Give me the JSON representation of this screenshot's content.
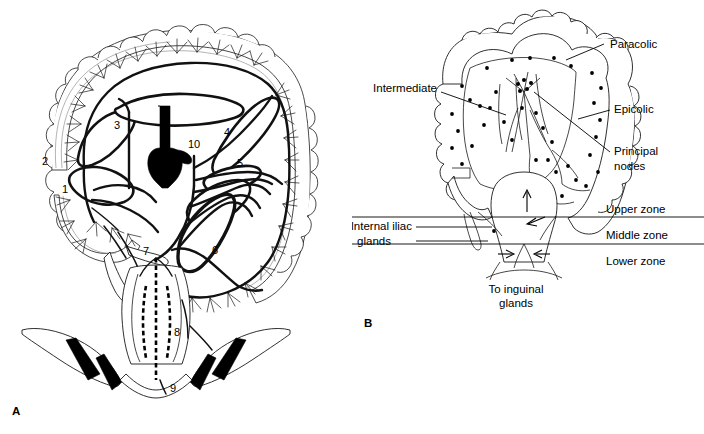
{
  "figure": {
    "panels": [
      {
        "id": "A",
        "letter": "A",
        "caption_letter": "A",
        "description": "Arterial and lymphatic vessel supply of the colon and rectum with numbered structures",
        "numbered_markers": [
          {
            "n": "1",
            "x": 65,
            "y": 193
          },
          {
            "n": "2",
            "x": 45,
            "y": 165
          },
          {
            "n": "3",
            "x": 117,
            "y": 129
          },
          {
            "n": "4",
            "x": 227,
            "y": 136
          },
          {
            "n": "5",
            "x": 240,
            "y": 167
          },
          {
            "n": "6",
            "x": 215,
            "y": 254
          },
          {
            "n": "7",
            "x": 146,
            "y": 255
          },
          {
            "n": "8",
            "x": 177,
            "y": 336
          },
          {
            "n": "9",
            "x": 173,
            "y": 392
          },
          {
            "n": "10",
            "x": 194,
            "y": 148
          }
        ]
      },
      {
        "id": "B",
        "letter": "B",
        "caption_letter": "B",
        "description": "Lymph node groups of the colon and the three rectal zones",
        "callouts": [
          {
            "text": "Paracolic",
            "x": 610,
            "y": 48,
            "anchor": "start"
          },
          {
            "text": "Epicolic",
            "x": 614,
            "y": 113,
            "anchor": "start"
          },
          {
            "text": "Principal",
            "x": 614,
            "y": 155,
            "anchor": "start"
          },
          {
            "text": "nodes",
            "x": 614,
            "y": 170,
            "anchor": "start"
          },
          {
            "text": "Intermediate",
            "x": 437,
            "y": 92,
            "anchor": "end"
          },
          {
            "text": "Internal iliac",
            "x": 412,
            "y": 230,
            "anchor": "end"
          },
          {
            "text": "glands",
            "x": 391,
            "y": 245,
            "anchor": "end"
          },
          {
            "text": "To inguinal",
            "x": 516,
            "y": 288,
            "anchor": "middle"
          },
          {
            "text": "glands",
            "x": 516,
            "y": 301,
            "anchor": "middle"
          }
        ],
        "zones": [
          {
            "text": "Upper zone",
            "x": 606,
            "y": 213
          },
          {
            "text": "Middle zone",
            "x": 606,
            "y": 239
          },
          {
            "text": "Lower zone",
            "x": 606,
            "y": 265
          }
        ]
      }
    ],
    "colors": {
      "background": "#ffffff",
      "ink": "#000000",
      "line": "#1a1a1a",
      "faint_line": "#8a8a8a"
    }
  }
}
